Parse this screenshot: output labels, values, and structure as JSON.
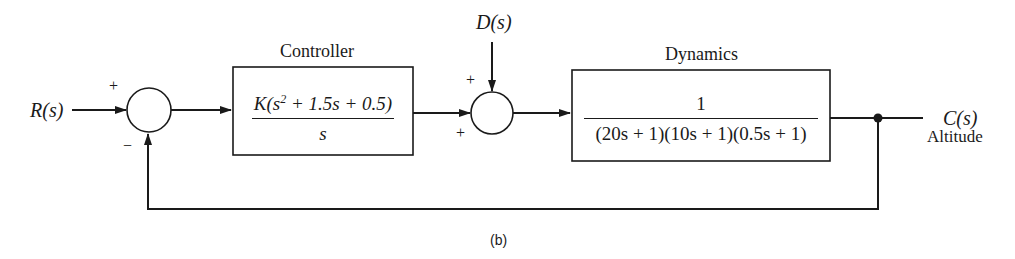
{
  "diagram": {
    "type": "feedback control block diagram",
    "caption": "(b)",
    "input": {
      "label": "R(s)"
    },
    "disturbance": {
      "label": "D(s)"
    },
    "output": {
      "label": "C(s)",
      "sublabel": "Altitude"
    },
    "summing_junction_1": {
      "top_sign": "+",
      "bottom_sign": "−"
    },
    "summing_junction_2": {
      "top_sign": "+",
      "bottom_sign": "+"
    },
    "controller": {
      "title": "Controller",
      "numerator_prefix": "K(s",
      "numerator_exp": "2",
      "numerator_suffix": " + 1.5s + 0.5)",
      "denominator": "s"
    },
    "dynamics": {
      "title": "Dynamics",
      "numerator": "1",
      "denominator": "(20s + 1)(10s + 1)(0.5s + 1)"
    },
    "line_color": "#1a1a1a"
  }
}
